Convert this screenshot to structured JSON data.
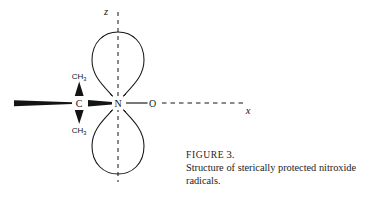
{
  "figure": {
    "label_word": "FIGURE",
    "number": "3.",
    "caption_line_1": "Structure of sterically protected nitroxide",
    "caption_line_2": "radicals."
  },
  "diagram": {
    "axes": {
      "z_label": "z",
      "x_label": "x"
    },
    "atoms": {
      "carbon": "C",
      "nitrogen": "N",
      "oxygen": "O"
    },
    "substituents": {
      "methyl_top_text": "CH",
      "methyl_top_sub": "3",
      "methyl_bottom_text": "CH",
      "methyl_bottom_sub": "3"
    },
    "colors": {
      "ink": "#141414",
      "background": "#ffffff"
    }
  }
}
